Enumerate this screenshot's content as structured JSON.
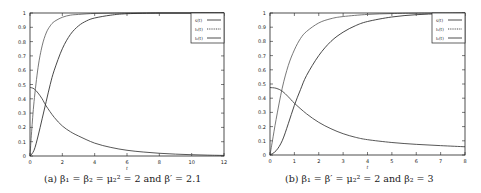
{
  "chart_data": [
    {
      "type": "line",
      "caption": "(a) β₁ = β₂ = μ₂² = 2 and β′ = 2.1",
      "xlabel": "t",
      "ylabel": "",
      "xlim": [
        0,
        12
      ],
      "ylim": [
        0,
        1
      ],
      "xticks": [
        0,
        2,
        4,
        6,
        8,
        10,
        12
      ],
      "yticks": [
        0,
        0.1,
        0.2,
        0.3,
        0.4,
        0.5,
        0.6,
        0.7,
        0.8,
        0.9,
        1
      ],
      "grid": false,
      "legend_position": "top-right",
      "legend": [
        "s(t)",
        "I₁(t)",
        "I₂(t)"
      ],
      "series": [
        {
          "name": "s(t)",
          "x": [
            0,
            0.25,
            0.5,
            0.75,
            1,
            1.5,
            2,
            2.5,
            3,
            4,
            5,
            6,
            7,
            8,
            9,
            10,
            11,
            12
          ],
          "values": [
            0.48,
            0.47,
            0.44,
            0.4,
            0.35,
            0.27,
            0.21,
            0.17,
            0.14,
            0.09,
            0.06,
            0.04,
            0.028,
            0.019,
            0.013,
            0.009,
            0.006,
            0.004
          ]
        },
        {
          "name": "I₁(t)",
          "x": [
            0,
            0.1,
            0.25,
            0.5,
            0.75,
            1,
            1.25,
            1.5,
            2,
            2.5,
            3,
            4,
            5,
            6,
            8,
            10,
            12
          ],
          "values": [
            0,
            0.17,
            0.38,
            0.62,
            0.77,
            0.86,
            0.91,
            0.94,
            0.97,
            0.985,
            0.99,
            0.997,
            0.999,
            1,
            1,
            1,
            1
          ]
        },
        {
          "name": "I₂(t)",
          "x": [
            0,
            0.25,
            0.5,
            0.75,
            1,
            1.25,
            1.5,
            2,
            2.5,
            3,
            3.5,
            4,
            5,
            6,
            8,
            10,
            12
          ],
          "values": [
            0,
            0.04,
            0.14,
            0.26,
            0.38,
            0.5,
            0.6,
            0.75,
            0.85,
            0.91,
            0.945,
            0.965,
            0.985,
            0.995,
            1,
            1,
            1
          ]
        }
      ]
    },
    {
      "type": "line",
      "caption": "(b) β₁ = β′ = μ₂² = 2 and β₂ = 3",
      "xlabel": "t",
      "ylabel": "",
      "xlim": [
        0,
        8
      ],
      "ylim": [
        0,
        1
      ],
      "xticks": [
        0,
        1,
        2,
        3,
        4,
        5,
        6,
        7,
        8
      ],
      "yticks": [
        0,
        0.1,
        0.2,
        0.3,
        0.4,
        0.5,
        0.6,
        0.7,
        0.8,
        0.9,
        1
      ],
      "grid": false,
      "legend_position": "top-right",
      "legend": [
        "s(t)",
        "I₁(t)",
        "I₂(t)"
      ],
      "series": [
        {
          "name": "s(t)",
          "x": [
            0,
            0.25,
            0.5,
            0.75,
            1,
            1.5,
            2,
            2.5,
            3,
            3.5,
            4,
            5,
            6,
            7,
            8
          ],
          "values": [
            0.475,
            0.47,
            0.45,
            0.41,
            0.365,
            0.29,
            0.23,
            0.185,
            0.15,
            0.125,
            0.108,
            0.088,
            0.075,
            0.066,
            0.058
          ]
        },
        {
          "name": "I₁(t)",
          "x": [
            0,
            0.1,
            0.25,
            0.5,
            0.75,
            1,
            1.25,
            1.5,
            2,
            2.5,
            3,
            4,
            5,
            6,
            8
          ],
          "values": [
            0,
            0.1,
            0.25,
            0.47,
            0.63,
            0.74,
            0.82,
            0.87,
            0.93,
            0.96,
            0.975,
            0.99,
            0.996,
            0.999,
            1
          ]
        },
        {
          "name": "I₂(t)",
          "x": [
            0,
            0.25,
            0.5,
            0.75,
            1,
            1.25,
            1.5,
            2,
            2.5,
            3,
            3.5,
            4,
            5,
            6,
            7,
            8
          ],
          "values": [
            0,
            0.03,
            0.1,
            0.22,
            0.35,
            0.46,
            0.56,
            0.7,
            0.8,
            0.865,
            0.91,
            0.94,
            0.972,
            0.988,
            0.995,
            0.998
          ]
        }
      ]
    }
  ],
  "colors": {
    "axis": "#222222",
    "s": "#444444",
    "i1": "#555555",
    "i2": "#333333"
  }
}
